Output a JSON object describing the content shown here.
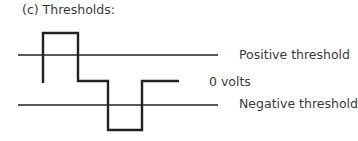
{
  "title": "(c) Thresholds:",
  "labels": {
    "positive": "Positive threshold",
    "zero": "0 volts",
    "negative": "Negative threshold"
  },
  "colors": {
    "line": "#222222",
    "text": "#3a3a3a"
  }
}
